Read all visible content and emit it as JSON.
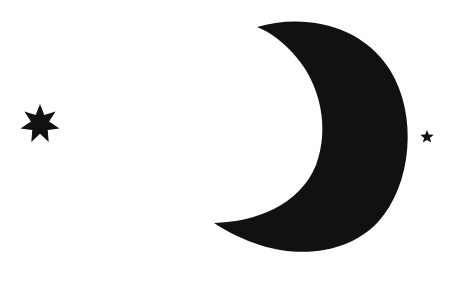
{
  "scene": {
    "description": "Black crescent moon with two stars on white background",
    "background_color": "#ffffff",
    "fill_color": "#111111",
    "elements": [
      {
        "name": "seven-point-star",
        "points": 7,
        "cx": 40,
        "cy": 124
      },
      {
        "name": "crescent-moon"
      },
      {
        "name": "five-point-star",
        "points": 5,
        "cx": 427,
        "cy": 137
      }
    ]
  }
}
